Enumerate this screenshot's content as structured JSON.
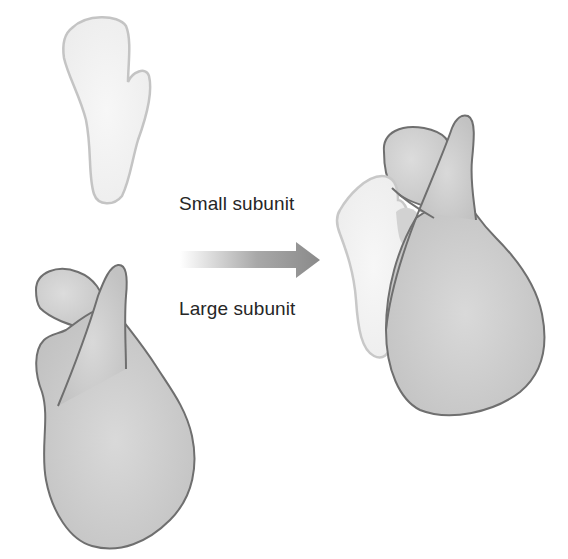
{
  "diagram": {
    "type": "ribosome-assembly",
    "labels": {
      "small_subunit": "Small subunit",
      "large_subunit": "Large subunit"
    },
    "arrow": {
      "direction": "right",
      "meaning": "assembly"
    },
    "colors": {
      "small_fill": "#f1f1f1",
      "small_stroke": "#c4c4c4",
      "large_fill": "#c9c9c9",
      "large_fill_light": "#dadada",
      "large_stroke": "#6f6f6f",
      "arrow_start": "#ffffff",
      "arrow_end": "#8a8a8a",
      "text": "#262626"
    }
  }
}
